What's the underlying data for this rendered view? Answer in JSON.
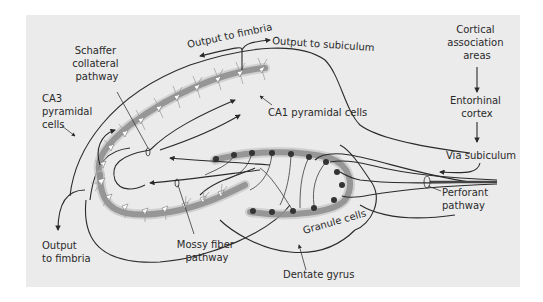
{
  "figure": {
    "type": "hippocampal circuit diagram",
    "background_color": "#ebebeb",
    "line_color": "#2a2a2a",
    "labels": {
      "schaffer": [
        "Schaffer",
        "collateral",
        "pathway"
      ],
      "output_fimbria_top": "Output to fimbria",
      "output_subiculum": "Output to subiculum",
      "ca3": [
        "CA3",
        "pyramidal",
        "cells"
      ],
      "ca1": "CA1 pyramidal cells",
      "cortical": [
        "Cortical",
        "association",
        "areas"
      ],
      "entorhinal": [
        "Entorhinal",
        "cortex"
      ],
      "via_subiculum": "Via subiculum",
      "perforant": [
        "Perforant",
        "pathway"
      ],
      "output_fimbria_bottom": [
        "Output",
        "to fimbria"
      ],
      "mossy": [
        "Mossy fiber",
        "pathway"
      ],
      "granule": "Granule cells",
      "dentate": "Dentate gyrus"
    }
  }
}
